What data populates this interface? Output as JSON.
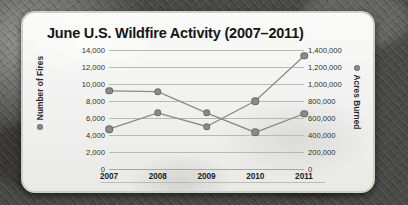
{
  "chart_data": {
    "type": "line",
    "title": "June U.S. Wildfire Activity (2007–2011)",
    "categories": [
      "2007",
      "2008",
      "2009",
      "2010",
      "2011"
    ],
    "x": [
      2007,
      2008,
      2009,
      2010,
      2011
    ],
    "xlabel": "",
    "grid": true,
    "legend_position": "axis-titles",
    "series": [
      {
        "name": "Number of Fires",
        "axis": "left",
        "values": [
          9200,
          9100,
          6600,
          4300,
          6500
        ],
        "color": "#8a8a8a"
      },
      {
        "name": "Acres Burned",
        "axis": "right",
        "values": [
          470000,
          660000,
          500000,
          800000,
          1330000
        ],
        "color": "#8a8a8a"
      }
    ],
    "left_axis": {
      "label": "Number of Fires",
      "ylim": [
        0,
        14000
      ],
      "tick_step": 2000,
      "ticks": [
        14000,
        12000,
        10000,
        8000,
        6000,
        4000,
        2000,
        0
      ],
      "tick_labels": [
        "14,000",
        "12,000",
        "10,000",
        "8,000",
        "6,000",
        "4,000",
        "2,000",
        "0"
      ]
    },
    "right_axis": {
      "label": "Acres Burned",
      "ylim": [
        0,
        1400000
      ],
      "tick_step": 200000,
      "ticks": [
        1400000,
        1200000,
        1000000,
        800000,
        600000,
        400000,
        200000,
        0
      ],
      "tick_labels": [
        "1,400,000",
        "1,200,000",
        "1,000,000",
        "800,000",
        "600,000",
        "400,000",
        "200,000",
        "0"
      ]
    }
  },
  "legend_marker": "series-dot-icon"
}
